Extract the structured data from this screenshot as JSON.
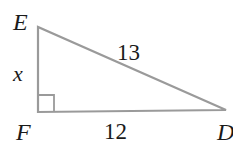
{
  "diagram": {
    "type": "right-triangle",
    "line_color": "#9a9a9a",
    "vertices": {
      "E": {
        "label": "E",
        "x": 38,
        "y": 27
      },
      "F": {
        "label": "F",
        "x": 38,
        "y": 112
      },
      "D": {
        "label": "D",
        "x": 226,
        "y": 110
      }
    },
    "right_angle_at": "F",
    "sides": {
      "EF": {
        "label": "x"
      },
      "ED": {
        "label": "13"
      },
      "FD": {
        "label": "12"
      }
    }
  }
}
